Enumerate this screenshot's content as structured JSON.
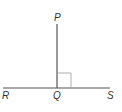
{
  "diagram": {
    "type": "geometry",
    "points": {
      "P": {
        "label": "P",
        "x": 57,
        "y": 24
      },
      "Q": {
        "label": "Q",
        "x": 57,
        "y": 88
      },
      "R": {
        "label": "R",
        "x": 3,
        "y": 88
      },
      "S": {
        "label": "S",
        "x": 110,
        "y": 88
      }
    },
    "right_angle_marker": {
      "at": "Q",
      "size": 14
    },
    "colors": {
      "line": "#555555",
      "marker": "#999999",
      "label": "#333333"
    }
  }
}
